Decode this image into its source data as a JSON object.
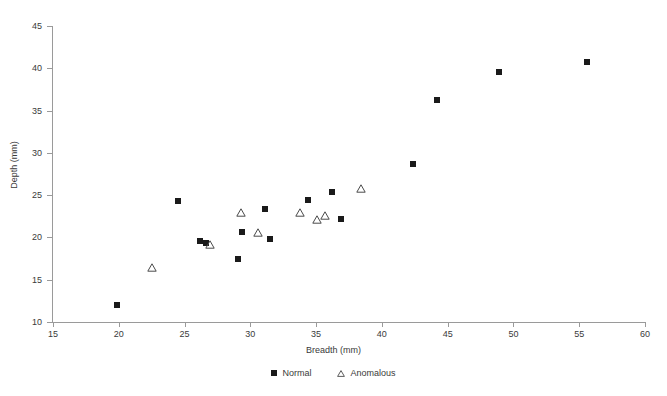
{
  "chart_data": {
    "type": "scatter",
    "title": "",
    "xlabel": "Breadth (mm)",
    "ylabel": "Depth (mm)",
    "xlim": [
      15,
      60
    ],
    "ylim": [
      10,
      45
    ],
    "xticks": [
      15,
      20,
      25,
      30,
      35,
      40,
      45,
      50,
      55,
      60
    ],
    "yticks": [
      10,
      15,
      20,
      25,
      30,
      35,
      40,
      45
    ],
    "grid": false,
    "legend_position": "bottom-center",
    "series": [
      {
        "name": "Normal",
        "marker": "filled-square",
        "color": "#1a1a1a",
        "points": [
          [
            19.9,
            12.0
          ],
          [
            24.5,
            24.3
          ],
          [
            26.2,
            19.6
          ],
          [
            26.6,
            19.4
          ],
          [
            29.1,
            17.5
          ],
          [
            29.4,
            20.6
          ],
          [
            31.1,
            23.4
          ],
          [
            31.5,
            19.8
          ],
          [
            34.4,
            24.4
          ],
          [
            36.2,
            25.4
          ],
          [
            36.9,
            22.2
          ],
          [
            42.4,
            28.7
          ],
          [
            44.2,
            36.2
          ],
          [
            48.9,
            39.6
          ],
          [
            55.6,
            40.8
          ]
        ]
      },
      {
        "name": "Anomalous",
        "marker": "open-triangle",
        "color": "#4a4a4a",
        "points": [
          [
            22.5,
            16.5
          ],
          [
            26.9,
            19.2
          ],
          [
            29.3,
            23.0
          ],
          [
            30.6,
            20.6
          ],
          [
            33.8,
            23.0
          ],
          [
            35.1,
            22.2
          ],
          [
            35.7,
            22.6
          ],
          [
            38.4,
            25.9
          ]
        ]
      }
    ]
  },
  "legend": {
    "items": [
      {
        "label": "Normal",
        "marker": "filled-square"
      },
      {
        "label": "Anomalous",
        "marker": "open-triangle"
      }
    ]
  }
}
